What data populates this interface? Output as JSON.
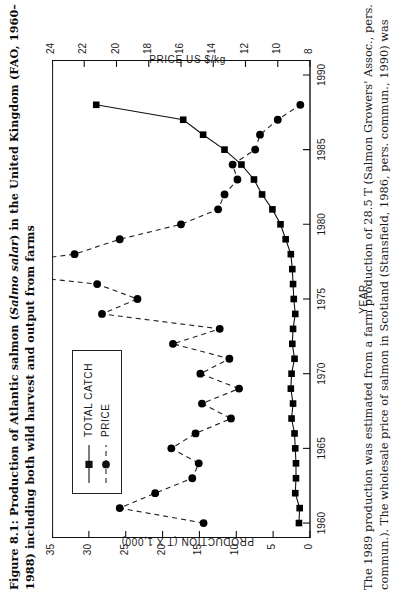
{
  "figure": {
    "title_prefix": "Figure 8.1: Production of Atlantic salmon (",
    "title_italic": "Salmo salar",
    "title_suffix": ") in the United Kingdom (FAO, 1960–1988) including both wild harvest and output from farms",
    "note": "The 1989 production was estimated from a farm production of 28.5 T (Salmon Growers' Assoc., pers. commun.). The wholesale price of salmon in Scotland (Stansfield, 1986, pers. commun., 1990) was"
  },
  "chart_data": {
    "type": "line",
    "xlabel": "YEAR",
    "ylabel": "PRODUCTION (T X 1,000)",
    "y2label": "PRICE US $/kg",
    "xlim": [
      1959,
      1991
    ],
    "ylim": [
      0,
      35
    ],
    "y2lim": [
      8,
      24
    ],
    "xticks": [
      1960,
      1965,
      1970,
      1975,
      1980,
      1985,
      1990
    ],
    "yticks": [
      0,
      5,
      10,
      15,
      20,
      25,
      30,
      35
    ],
    "y2ticks": [
      8,
      10,
      12,
      14,
      16,
      18,
      20,
      22,
      24
    ],
    "grid": false,
    "legend_position": "upper-left",
    "series": [
      {
        "name": "TOTAL CATCH",
        "axis": "left",
        "line_style": "solid",
        "marker": "square",
        "color": "#000000",
        "x": [
          1960,
          1961,
          1962,
          1963,
          1964,
          1965,
          1966,
          1967,
          1968,
          1969,
          1970,
          1971,
          1972,
          1973,
          1974,
          1975,
          1976,
          1977,
          1978,
          1979,
          1980,
          1981,
          1982,
          1983,
          1984,
          1985,
          1986,
          1987,
          1988
        ],
        "values": [
          1.5,
          1.4,
          2.0,
          1.9,
          1.9,
          2.0,
          2.1,
          2.5,
          2.3,
          2.6,
          2.5,
          2.1,
          2.4,
          2.3,
          2.0,
          2.2,
          2.3,
          2.4,
          2.6,
          3.3,
          4.0,
          5.1,
          6.5,
          7.6,
          9.3,
          11.6,
          14.5,
          17.2,
          29.0
        ]
      },
      {
        "name": "PRICE",
        "axis": "right",
        "line_style": "dashed",
        "marker": "circle",
        "color": "#000000",
        "x": [
          1960,
          1961,
          1962,
          1963,
          1964,
          1965,
          1966,
          1967,
          1968,
          1969,
          1970,
          1971,
          1972,
          1973,
          1974,
          1975,
          1976,
          1977,
          1978,
          1979,
          1980,
          1981,
          1982,
          1983,
          1984,
          1985,
          1986,
          1987,
          1988
        ],
        "values": [
          14.6,
          19.8,
          17.6,
          15.3,
          14.9,
          16.6,
          15.1,
          12.9,
          14.7,
          12.4,
          14.8,
          13.0,
          16.5,
          13.6,
          20.9,
          18.7,
          21.2,
          30.0,
          22.6,
          19.8,
          16.0,
          13.7,
          13.3,
          12.5,
          12.8,
          11.4,
          11.1,
          10.0,
          8.6
        ]
      }
    ]
  },
  "legend": {
    "items": [
      {
        "label": "TOTAL CATCH",
        "marker": "square",
        "dash": "solid"
      },
      {
        "label": "PRICE",
        "marker": "circle",
        "dash": "dashed"
      }
    ]
  }
}
